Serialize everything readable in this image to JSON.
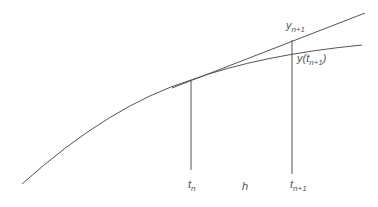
{
  "diagram": {
    "colors": {
      "line": "#555555",
      "text": "#555555",
      "background": "#ffffff"
    },
    "labels": {
      "y_next": {
        "base": "y",
        "sub": "n+1"
      },
      "y_true": {
        "base": "y(t",
        "sub": "n+1",
        "close": ")"
      },
      "t_n": {
        "base": "t",
        "sub": "n"
      },
      "h": "h",
      "t_next": {
        "base": "t",
        "sub": "n+1"
      }
    }
  }
}
